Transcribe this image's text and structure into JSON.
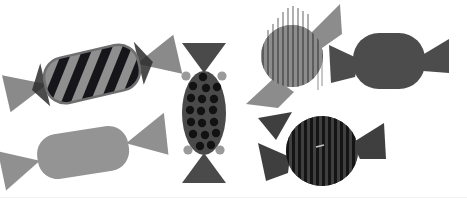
{
  "scene": {
    "title": "Assorted wrapped candies illustration",
    "width": 467,
    "height": 204,
    "background_color": "#ffffff",
    "baseline_color": "#f2f2f2",
    "palette": {
      "light_gray": "#a6a6a6",
      "mid_gray": "#8f8f8f",
      "dark_gray": "#4d4d4d",
      "darker_gray": "#414141",
      "near_black": "#1c1c1c",
      "black": "#111111",
      "wrapper_light": "#9a9a9a",
      "wrapper_dark": "#4a4a4a"
    }
  },
  "candies": [
    {
      "id": "candy-striped-diagonal",
      "label": "Diagonally striped candy",
      "body_shape": "rounded-rectangle",
      "pattern": "diagonal-stripes",
      "body_color": "#8f8f8f",
      "stripe_color": "#16161a",
      "wrapper_color": "#8a8a8a",
      "rotation_deg": -13,
      "center_x": 92,
      "center_y": 74,
      "body_width": 96,
      "body_height": 46,
      "corner_radius": 20,
      "stripe_count": 6,
      "stripe_width": 9,
      "stripe_angle_deg": 35
    },
    {
      "id": "candy-plain-light",
      "label": "Plain light gray candy",
      "body_shape": "rounded-rectangle",
      "pattern": "solid",
      "body_color": "#949494",
      "stripe_color": "none",
      "wrapper_color": "#909090",
      "rotation_deg": -9,
      "center_x": 83,
      "center_y": 152,
      "body_width": 92,
      "body_height": 45,
      "corner_radius": 20,
      "stripe_count": 0
    },
    {
      "id": "candy-polka-dot",
      "label": "Polka dot candy, vertical",
      "body_shape": "ellipse",
      "pattern": "polka-dots",
      "body_color": "#4a4a4a",
      "dot_color": "#121212",
      "wrapper_color": "#4a4a4a",
      "accent_color": "#9a9a9a",
      "rotation_deg": 0,
      "center_x": 204,
      "center_y": 113,
      "body_width": 44,
      "body_height": 84,
      "dot_radius": 4.2,
      "dot_rows": 5,
      "dot_cols": 4,
      "accent_dots": 4
    },
    {
      "id": "candy-vertical-stripes-light",
      "label": "Light candy with vertical stripes and fringe",
      "body_shape": "circle",
      "pattern": "vertical-stripes-fringed",
      "body_color": "#8c8c8c",
      "stripe_color": "#5a5a5a",
      "wrapper_color": "#8c8c8c",
      "rotation_deg": 0,
      "center_x": 292,
      "center_y": 56,
      "body_width": 62,
      "body_height": 62,
      "stripe_count": 13,
      "stripe_width": 2,
      "fringe_overhang": 22
    },
    {
      "id": "candy-plain-dark",
      "label": "Plain dark gray candy",
      "body_shape": "rounded-blob",
      "pattern": "solid",
      "body_color": "#4c4c4c",
      "stripe_color": "none",
      "wrapper_color": "#4c4c4c",
      "rotation_deg": 0,
      "center_x": 389,
      "center_y": 61,
      "body_width": 72,
      "body_height": 56,
      "corner_radius": 26,
      "stripe_count": 0
    },
    {
      "id": "candy-vertical-stripes-dark",
      "label": "Dark candy with vertical stripes",
      "body_shape": "circle",
      "pattern": "vertical-stripes",
      "body_color": "#3f3f3f",
      "stripe_color": "#141414",
      "wrapper_color": "#3f3f3f",
      "rotation_deg": 0,
      "center_x": 322,
      "center_y": 151,
      "body_width": 72,
      "body_height": 70,
      "stripe_count": 13,
      "stripe_width": 3
    }
  ]
}
